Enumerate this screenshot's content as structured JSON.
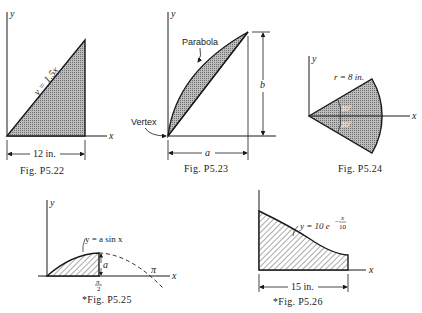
{
  "figures": [
    {
      "id": "p5_22",
      "caption": "Fig. P5.22",
      "axis_x": "x",
      "axis_y": "y",
      "curve_label": "y = 1.5x",
      "dimension": "12 in."
    },
    {
      "id": "p5_23",
      "caption": "Fig. P5.23",
      "axis_x": "x",
      "axis_y": "y",
      "curve_label": "Parabola",
      "vertex_label": "Vertex",
      "dim_width": "a",
      "dim_height": "b"
    },
    {
      "id": "p5_24",
      "caption": "Fig. P5.24",
      "axis_x": "x",
      "axis_y": "y",
      "radius_label": "r = 8 in.",
      "angle_upper": "30°",
      "angle_lower": "30°"
    },
    {
      "id": "p5_25",
      "caption": "*Fig. P5.25",
      "axis_x": "x",
      "axis_y": "y",
      "curve_label": "y = a sin x",
      "amplitude": "a",
      "half_pi_num": "π",
      "half_pi_den": "2",
      "pi_label": "π"
    },
    {
      "id": "p5_26",
      "caption": "*Fig. P5.26",
      "axis_x": "x",
      "axis_y": "y",
      "curve_label_main": "y = 10 e",
      "curve_exp_num": "x",
      "curve_exp_den": "10",
      "curve_exp_sign": "−",
      "dimension": "15 in."
    }
  ]
}
